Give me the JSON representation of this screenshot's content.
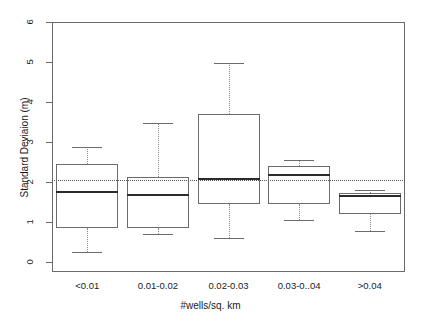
{
  "figure": {
    "width": 421,
    "height": 321,
    "background": "#ffffff"
  },
  "chart_data": {
    "type": "box",
    "title": "",
    "xlabel": "#wells/sq. km",
    "ylabel": "Standard Deviaion (m)",
    "categories": [
      "<0.01",
      "0.01-0.02",
      "0.02-0.03",
      "0.03-0..04",
      ">0.04"
    ],
    "ylim": [
      -0.05,
      6.1
    ],
    "yticks": [
      0,
      1,
      2,
      3,
      4,
      5,
      6
    ],
    "ytick_labels": [
      "0",
      "1",
      "2",
      "3",
      "4",
      "5",
      "6"
    ],
    "grid": false,
    "legend": null,
    "reference_line": {
      "orientation": "horizontal",
      "value": 2.05,
      "style": "dotted",
      "color": "#555555"
    },
    "boxes": [
      {
        "category": "<0.01",
        "whisker_low": 0.25,
        "q1": 0.85,
        "median": 1.78,
        "q3": 2.45,
        "whisker_high": 2.88
      },
      {
        "category": "0.01-0.02",
        "whisker_low": 0.71,
        "q1": 0.85,
        "median": 1.7,
        "q3": 2.12,
        "whisker_high": 3.47
      },
      {
        "category": "0.02-0.03",
        "whisker_low": 0.59,
        "q1": 1.46,
        "median": 2.09,
        "q3": 3.7,
        "whisker_high": 4.97
      },
      {
        "category": "0.03-0..04",
        "whisker_low": 1.04,
        "q1": 1.46,
        "median": 2.21,
        "q3": 2.4,
        "whisker_high": 2.55
      },
      {
        "category": ">0.04",
        "whisker_low": 0.78,
        "q1": 1.21,
        "median": 1.67,
        "q3": 1.73,
        "whisker_high": 1.79
      }
    ],
    "colors": {
      "box_border": "#6b6b6b",
      "median": "#2b2b2b",
      "whisker": "#8a8a8a",
      "axis": "#6b6b6b",
      "text": "#1a1a1a"
    }
  }
}
